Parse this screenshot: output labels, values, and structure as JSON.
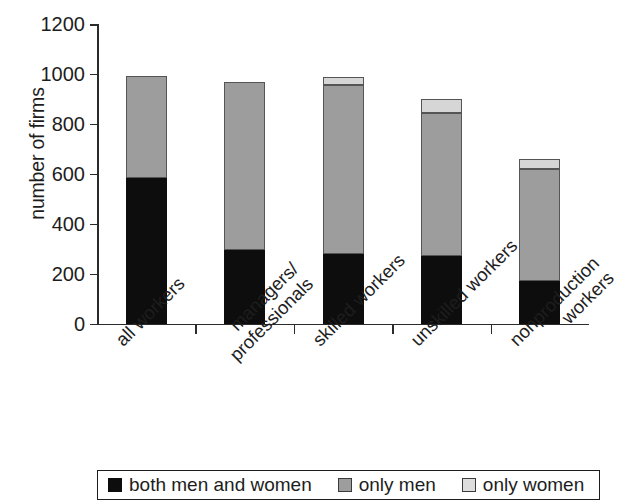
{
  "chart_data": {
    "type": "bar",
    "stacked": true,
    "title": "",
    "xlabel": "",
    "ylabel": "number of firms",
    "ylim": [
      0,
      1200
    ],
    "ytick_labels": [
      "1200",
      "1000",
      "800",
      "600",
      "400",
      "200",
      "0"
    ],
    "ytick_values": [
      1200,
      1000,
      800,
      600,
      400,
      200,
      0
    ],
    "grid": false,
    "legend_position": "bottom",
    "categories": [
      "all workers",
      "managers/professionals",
      "skilled workers",
      "unskilled workers",
      "nonproduction workers"
    ],
    "category_lines": [
      [
        "all workers"
      ],
      [
        "managers/",
        "professionals"
      ],
      [
        "skilled workers"
      ],
      [
        "unskilled workers"
      ],
      [
        "nonproduction",
        "workers"
      ]
    ],
    "series": [
      {
        "name": "both men and women",
        "color": "#0d0d0d",
        "values": [
          585,
          295,
          280,
          270,
          170
        ]
      },
      {
        "name": "only men",
        "color": "#9d9d9d",
        "values": [
          405,
          673,
          675,
          575,
          448
        ]
      },
      {
        "name": "only women",
        "color": "#d6d6d6",
        "values": [
          0,
          0,
          33,
          53,
          42
        ]
      }
    ],
    "totals": [
      990,
      968,
      988,
      898,
      660
    ]
  },
  "legend": {
    "items": [
      {
        "label": "both men and women",
        "swatch": "black"
      },
      {
        "label": "only men",
        "swatch": "gray"
      },
      {
        "label": "only women",
        "swatch": "light"
      }
    ]
  }
}
